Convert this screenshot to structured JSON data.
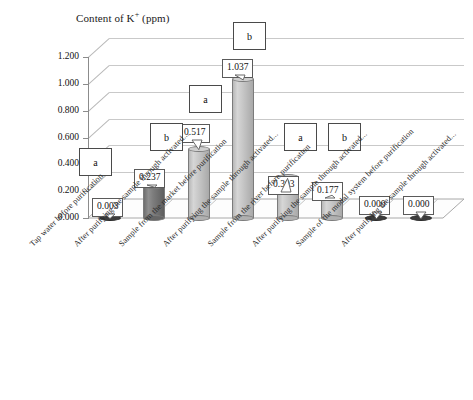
{
  "chart_data": {
    "type": "bar",
    "title": "Content of K+ (ppm)",
    "title_main": "Content of K",
    "title_sup": "+",
    "title_unit": " (ppm)",
    "xlabel": "",
    "ylabel": "",
    "ylim": [
      0.0,
      1.2
    ],
    "grid": true,
    "legend": "none",
    "y_ticks": [
      "0.000",
      "0.200",
      "0.400",
      "0.600",
      "0.800",
      "1.000",
      "1.200"
    ],
    "y_tick_values": [
      0.0,
      0.2,
      0.4,
      0.6,
      0.8,
      1.0,
      1.2
    ],
    "categories": [
      "Tap water before purification",
      "After purifying the sample through activated...",
      "Sample from the market before purification",
      "After purifying the sample through activated...",
      "Sample from the river before purification",
      "After purifying the sample through activated...",
      "Sample of the modal system before purification",
      "After purifying the sample through activated..."
    ],
    "values": [
      0.003,
      0.237,
      0.517,
      1.037,
      0.303,
      0.177,
      0.0,
      0.0
    ],
    "data_labels": [
      "0.003",
      "0.237",
      "0.517",
      "1.037",
      "0.303",
      "0.177",
      "0.000",
      "0.000"
    ],
    "group_letters": [
      "a",
      "b",
      "a",
      "b",
      "a",
      "b",
      "",
      ""
    ],
    "bar_shades": [
      "light",
      "dark",
      "light",
      "light",
      "light",
      "light",
      "light",
      "light"
    ],
    "colors": {
      "bar_light": "#c9c9c9",
      "bar_dark": "#7d7d7d",
      "gridline": "#c9c9c9",
      "axis": "#8c8c8c",
      "text": "#111111",
      "callout_border": "#5a5a5a",
      "background": "#ffffff"
    }
  }
}
